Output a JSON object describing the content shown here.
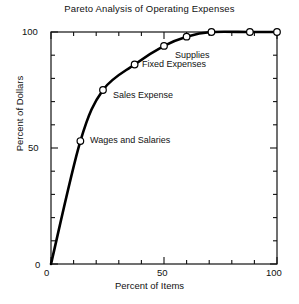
{
  "chart_data": {
    "type": "line",
    "title": "Pareto Analysis of Operating Expenses",
    "xlabel": "Percent of Items",
    "ylabel": "Percent of Dollars",
    "xlim": [
      0,
      100
    ],
    "ylim": [
      0,
      100
    ],
    "xticks": [
      0,
      50,
      100
    ],
    "xtick_labels": [
      "0",
      "50",
      "100"
    ],
    "yticks": [
      0,
      50,
      100
    ],
    "ytick_labels": [
      "0",
      "50",
      "100"
    ],
    "minor_tick_interval": 10,
    "grid": false,
    "legend": false,
    "marker": "open-circle",
    "line_color": "#000000",
    "x": [
      0,
      13,
      23,
      37,
      50,
      60,
      71,
      88,
      100
    ],
    "y": [
      0,
      53,
      75,
      86,
      94,
      98,
      100,
      100,
      100
    ],
    "points": [
      {
        "x": 13,
        "y": 53,
        "label": "Wages and Salaries"
      },
      {
        "x": 23,
        "y": 75,
        "label": "Sales Expense"
      },
      {
        "x": 37,
        "y": 86,
        "label": "Fixed Expenses"
      },
      {
        "x": 50,
        "y": 94,
        "label": "Supplies"
      },
      {
        "x": 60,
        "y": 98,
        "label": ""
      },
      {
        "x": 71,
        "y": 100,
        "label": ""
      },
      {
        "x": 88,
        "y": 100,
        "label": ""
      },
      {
        "x": 100,
        "y": 100,
        "label": ""
      }
    ],
    "annotations": [
      {
        "text": "Supplies",
        "x": 50,
        "y": 94
      },
      {
        "text": "Fixed Expenses",
        "x": 37,
        "y": 86
      },
      {
        "text": "Sales Expense",
        "x": 23,
        "y": 75
      },
      {
        "text": "Wages and Salaries",
        "x": 13,
        "y": 53
      }
    ]
  },
  "axis_labels": {
    "y_top": "100",
    "y_mid": "50",
    "y_bottom": "0",
    "x_left": "0",
    "x_mid": "50",
    "x_right": "100"
  },
  "point_labels": {
    "supplies": "Supplies",
    "fixed_expenses": "Fixed Expenses",
    "sales_expense": "Sales Expense",
    "wages_and_salaries": "Wages and Salaries"
  }
}
